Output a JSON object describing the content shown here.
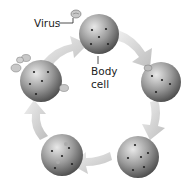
{
  "diagram": {
    "labels": {
      "virus": "Virus",
      "body_cell_line1": "Body",
      "body_cell_line2": "cell"
    },
    "stages": [
      {
        "name": "healthy-cell",
        "description": "Body cell with virus approaching"
      },
      {
        "name": "virus-attached",
        "description": "Virus attaches to cell"
      },
      {
        "name": "virus-inside",
        "description": "Virus material inside cell"
      },
      {
        "name": "replicating",
        "description": "New viruses forming in cell"
      },
      {
        "name": "release",
        "description": "New viruses released from cell"
      }
    ],
    "colors": {
      "cell_light": "#e6e6e6",
      "cell_dark": "#555555",
      "arrow": "#c8c8c8",
      "text": "#222222"
    }
  }
}
